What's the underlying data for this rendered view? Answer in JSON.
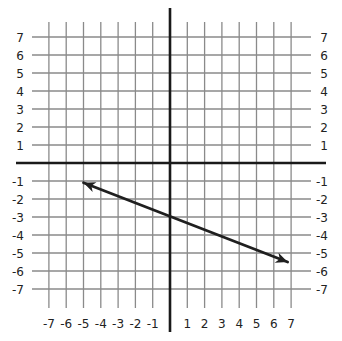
{
  "chart_data": {
    "type": "line",
    "title": "",
    "xlabel": "",
    "ylabel": "",
    "xlim": [
      -7,
      7
    ],
    "ylim": [
      -7,
      7
    ],
    "grid": true,
    "legend": null,
    "x_tick_labels": [
      "-7",
      "-6",
      "-5",
      "-4",
      "-3",
      "-2",
      "-1",
      "1",
      "2",
      "3",
      "4",
      "5",
      "6",
      "7"
    ],
    "y_tick_labels_left": [
      "7",
      "6",
      "5",
      "4",
      "3",
      "2",
      "1",
      "-1",
      "-2",
      "-3",
      "-4",
      "-5",
      "-6",
      "-7"
    ],
    "y_tick_labels_right": [
      "7",
      "6",
      "5",
      "4",
      "3",
      "2",
      "1",
      "-1",
      "-2",
      "-3",
      "-4",
      "-5",
      "-6",
      "-7"
    ],
    "series": [
      {
        "name": "line",
        "style": "double-arrow",
        "equation": "y = -3/8 x - 3",
        "x": [
          -5,
          6.8
        ],
        "y": [
          -1.1,
          -5.5
        ],
        "y_intercept": -3
      }
    ]
  },
  "colors": {
    "grid": "#8a8a8a",
    "axes": "#1a1a1a",
    "line": "#1f1f1f",
    "labels": "#222222"
  }
}
